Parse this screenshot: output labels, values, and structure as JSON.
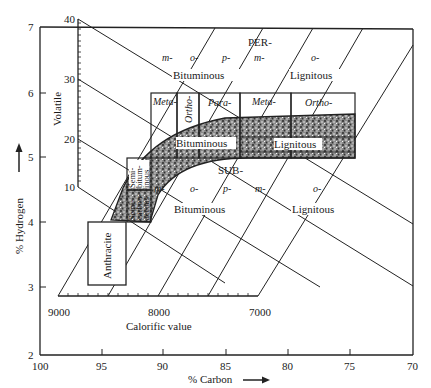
{
  "figure": {
    "type": "Seyler coal classification diagram",
    "x_axis": {
      "label": "% Carbon",
      "ticks": [
        "100",
        "95",
        "90",
        "85",
        "80",
        "75",
        "70"
      ]
    },
    "y_axis": {
      "label": "% Hydrogen",
      "ticks": [
        "2",
        "3",
        "4",
        "5",
        "6",
        "7"
      ]
    },
    "volatile_axis": {
      "label": "Volatile",
      "ticks": [
        "10",
        "20",
        "30",
        "40"
      ]
    },
    "calorific_axis": {
      "label": "Calorific value",
      "ticks": [
        "9000",
        "8000",
        "7000"
      ]
    },
    "regions": {
      "per": "PER-",
      "sub": "SUB-",
      "bituminous_top": "Bituminous",
      "lignitous_top": "Lignitous",
      "bituminous_band": "Bituminous",
      "lignitous_band": "Lignitous",
      "bituminous_bottom": "Bituminous",
      "lignitous_bottom": "Lignitous",
      "anthracite": "Anthracite",
      "semi_bituminous": [
        "Semi-",
        "bitum-",
        "inous"
      ],
      "carbonaceous": [
        "Semi-",
        "carbon-",
        "aceous"
      ]
    },
    "prefixes_top": [
      "m-",
      "o-",
      "p-",
      "m-",
      "o-"
    ],
    "prefixes_bottom": [
      "m-",
      "o-",
      "p-",
      "m-",
      "o-"
    ],
    "column_headers": [
      "Meta-",
      "Ortho-",
      "Para-",
      "Meta-",
      "Ortho-"
    ]
  }
}
